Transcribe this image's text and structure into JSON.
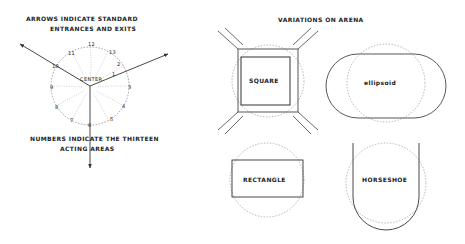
{
  "left": {
    "caption_top_1": "Arrows indicate standard",
    "caption_top_2": "entrances and exits",
    "caption_bottom_1": "Numbers indicate the thirteen",
    "caption_bottom_2": "acting areas",
    "center_label": "Center",
    "areas": [
      "1",
      "2",
      "3",
      "4",
      "5",
      "6",
      "7",
      "8",
      "9",
      "10",
      "11",
      "12",
      "13"
    ]
  },
  "right": {
    "title": "Variations on arena",
    "shapes": [
      {
        "label": "Square"
      },
      {
        "label": "ellipsoid"
      },
      {
        "label": "Rectangle"
      },
      {
        "label": "Horseshoe"
      }
    ]
  }
}
